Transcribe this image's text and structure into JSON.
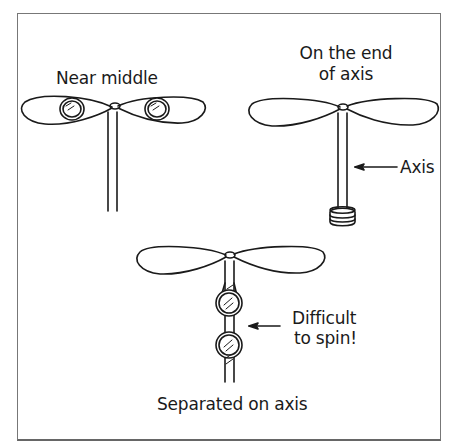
{
  "diagram": {
    "panels": [
      {
        "id": "near-middle",
        "label": "Near middle"
      },
      {
        "id": "end-of-axis",
        "label_line1": "On the end",
        "label_line2": "of axis",
        "callout": "Axis"
      },
      {
        "id": "separated",
        "label": "Separated on axis",
        "callout_line1": "Difficult",
        "callout_line2": "to spin!"
      }
    ]
  }
}
